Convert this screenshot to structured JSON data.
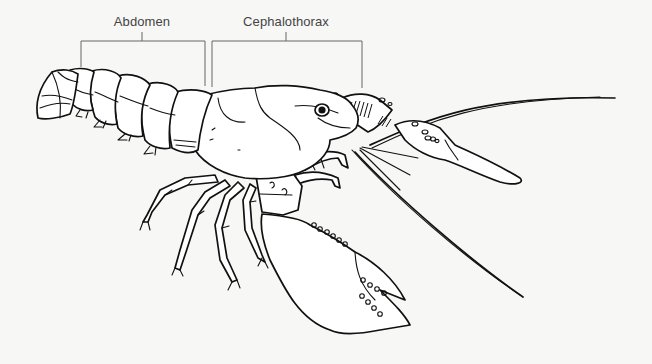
{
  "diagram": {
    "labels": [
      {
        "id": "abdomen",
        "text": "Abdomen",
        "x": 142,
        "y": 14,
        "bracket": {
          "left": 81,
          "right": 205,
          "top": 41,
          "left_end": 67,
          "right_end": 86
        }
      },
      {
        "id": "cephalothorax",
        "text": "Cephalothorax",
        "x": 286,
        "y": 14,
        "bracket": {
          "left": 212,
          "right": 362,
          "top": 41,
          "left_end": 87,
          "right_end": 88
        }
      }
    ],
    "colors": {
      "background": "#f7f7f5",
      "ink": "#111111",
      "label_text": "#444444",
      "bracket_line": "#666666"
    }
  }
}
